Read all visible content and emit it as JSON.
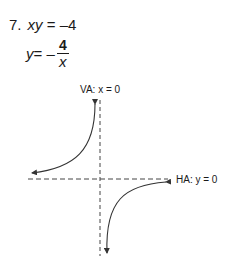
{
  "problem": {
    "number": "7.",
    "equation_lhs": "xy",
    "equation_eq": " = ",
    "equation_rhs": "–4",
    "solved_lhs": "y",
    "solved_eq": " = –",
    "fraction_numerator": "4",
    "fraction_denominator": "x"
  },
  "graph": {
    "vertical_asymptote_label": "VA: x = 0",
    "horizontal_asymptote_label": "HA: y = 0",
    "line_color": "#333333"
  }
}
